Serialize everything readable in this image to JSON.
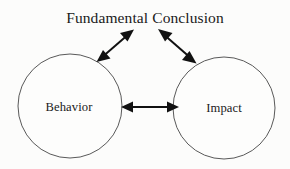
{
  "diagram": {
    "title": "Fundamental Conclusion",
    "background_color": "#fcfcfb",
    "stroke_color": "#595959",
    "arrow_color": "#111111",
    "text_color": "#1a1a1a",
    "nodes": [
      {
        "id": "behavior",
        "label": "Behavior",
        "shape": "circle",
        "cx": 70,
        "cy": 106,
        "r": 52
      },
      {
        "id": "impact",
        "label": "Impact",
        "shape": "circle",
        "cx": 224,
        "cy": 108,
        "r": 51
      }
    ],
    "title_node": {
      "id": "fundamental-conclusion",
      "label": "Fundamental Conclusion",
      "cx": 145,
      "cy": 18
    },
    "connectors": [
      {
        "id": "behavior-impact",
        "from": "behavior",
        "to": "impact",
        "style": "double-headed-arrow",
        "orientation": "horizontal"
      },
      {
        "id": "behavior-conclusion",
        "from": "behavior",
        "to": "fundamental-conclusion",
        "style": "double-headed-arrow",
        "orientation": "diagonal-up-right"
      },
      {
        "id": "conclusion-impact",
        "from": "fundamental-conclusion",
        "to": "impact",
        "style": "double-headed-arrow",
        "orientation": "diagonal-down-right"
      }
    ]
  }
}
